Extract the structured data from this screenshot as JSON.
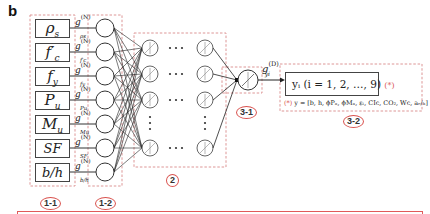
{
  "panel_label": "b",
  "inputs": [
    {
      "symbol": "ρ",
      "sub": "s",
      "prime": "",
      "g_sub": "ρs"
    },
    {
      "symbol": "f",
      "sub": "c",
      "prime": "′",
      "g_sub": "f′c"
    },
    {
      "symbol": "f",
      "sub": "y",
      "prime": "",
      "g_sub": "fy"
    },
    {
      "symbol": "P",
      "sub": "u",
      "prime": "",
      "g_sub": "Pu"
    },
    {
      "symbol": "M",
      "sub": "u",
      "prime": "",
      "g_sub": "Mu"
    },
    {
      "symbol": "SF",
      "sub": "",
      "prime": "",
      "g_sub": "SF"
    },
    {
      "symbol": "b/h",
      "sub": "",
      "prime": "",
      "g_sub": "b/h"
    }
  ],
  "input_labels": [
    "ρs",
    "f′c",
    "fy",
    "Pu",
    "Mu",
    "SF",
    "b/h"
  ],
  "g_prefix": "g",
  "g_superscript": "(N)",
  "output_g": {
    "prefix": "g",
    "superscript": "(D)",
    "subscript": "yi"
  },
  "output_box": {
    "text": "yᵢ (i = 1, 2, …, 9)",
    "star": "(*)"
  },
  "output_note": {
    "star": "(*)",
    "text": "y = [b, h, ϕPₙ, ϕMₙ, εₜ, CIc, CO₂, Wc, aₑ/ₕ]"
  },
  "section_tags": {
    "input_layer": "1-1",
    "normalization_layer": "1-2",
    "hidden_layers": "2",
    "output_neuron": "3-1",
    "output": "3-2"
  },
  "colors": {
    "dashed_box": "#d98a8a",
    "tag_circle": "#d9534f",
    "line": "#222222",
    "star": "#d9534f"
  }
}
